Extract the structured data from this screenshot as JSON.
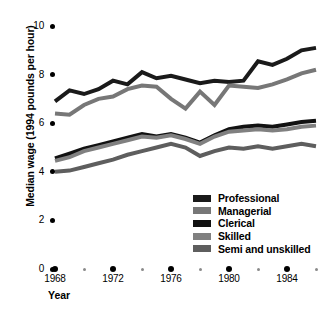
{
  "chart_data": {
    "type": "line",
    "title": "",
    "xlabel": "Year",
    "ylabel": "Median wage (1994 pounds per hour)",
    "xlim": [
      1968,
      1986
    ],
    "ylim": [
      0,
      10
    ],
    "grid": false,
    "legend_position": "inside-bottom-right",
    "y_ticks": [
      "0",
      "2",
      "4",
      "6",
      "8",
      "10"
    ],
    "y_tick_values": [
      0,
      2,
      4,
      6,
      8,
      10
    ],
    "x_ticks": [
      "1968",
      "1972",
      "1976",
      "1980",
      "1984"
    ],
    "x_tick_values": [
      1968,
      1972,
      1976,
      1980,
      1984
    ],
    "x_minor_tick_values": [
      1970,
      1974,
      1978,
      1982,
      1986
    ],
    "x": [
      1968,
      1969,
      1970,
      1971,
      1972,
      1973,
      1974,
      1975,
      1976,
      1977,
      1978,
      1979,
      1980,
      1981,
      1982,
      1983,
      1984,
      1985,
      1986
    ],
    "series": [
      {
        "name": "Professional",
        "color": "#1a1a1a",
        "values": [
          6.9,
          7.35,
          7.2,
          7.4,
          7.75,
          7.6,
          8.1,
          7.85,
          7.95,
          7.8,
          7.65,
          7.75,
          7.7,
          7.75,
          8.55,
          8.4,
          8.65,
          9.0,
          9.1
        ]
      },
      {
        "name": "Managerial",
        "color": "#777777",
        "values": [
          6.4,
          6.35,
          6.75,
          7.0,
          7.1,
          7.4,
          7.55,
          7.5,
          7.0,
          6.6,
          7.3,
          6.75,
          7.55,
          7.5,
          7.45,
          7.6,
          7.8,
          8.05,
          8.2
        ]
      },
      {
        "name": "Clerical",
        "color": "#111111",
        "values": [
          4.55,
          4.75,
          4.95,
          5.1,
          5.25,
          5.4,
          5.55,
          5.45,
          5.55,
          5.4,
          5.2,
          5.5,
          5.75,
          5.85,
          5.9,
          5.85,
          5.95,
          6.05,
          6.1
        ]
      },
      {
        "name": "Skilled",
        "color": "#808080",
        "values": [
          4.45,
          4.6,
          4.85,
          5.0,
          5.15,
          5.3,
          5.45,
          5.4,
          5.5,
          5.35,
          5.15,
          5.45,
          5.65,
          5.7,
          5.75,
          5.7,
          5.75,
          5.85,
          5.9
        ]
      },
      {
        "name": "Semi and unskilled",
        "color": "#5e5e5e",
        "values": [
          4.0,
          4.05,
          4.2,
          4.35,
          4.5,
          4.7,
          4.85,
          5.0,
          5.15,
          5.0,
          4.65,
          4.85,
          5.0,
          4.95,
          5.05,
          4.95,
          5.05,
          5.15,
          5.05
        ]
      }
    ]
  },
  "legend": {
    "items": [
      {
        "label": "Professional",
        "color": "#1a1a1a"
      },
      {
        "label": "Managerial",
        "color": "#777777"
      },
      {
        "label": "Clerical",
        "color": "#111111"
      },
      {
        "label": "Skilled",
        "color": "#808080"
      },
      {
        "label": "Semi and unskilled",
        "color": "#5e5e5e"
      }
    ]
  }
}
